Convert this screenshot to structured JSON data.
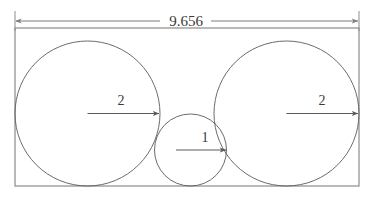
{
  "figure": {
    "colors": {
      "rectangle_stroke": "#8c8c8c",
      "circle_stroke": "#5a5a5a",
      "dimension_stroke": "#8c8c8c",
      "radius_leader_stroke": "#5a5a5a",
      "text": "#3a3a3a",
      "background": "#ffffff"
    },
    "overall_dimension": {
      "label": "9.656",
      "orientation": "horizontal",
      "position": "top",
      "arrowheads": "both-ends"
    },
    "circles": [
      {
        "name": "left-circle",
        "radius_label": "2",
        "cx": 87.5,
        "cy": 113.5,
        "r": 72.5,
        "leader_from_x": 87.5,
        "leader_to_x": 160,
        "leader_y": 113.5,
        "label_x": 120,
        "label_y": 105
      },
      {
        "name": "middle-circle",
        "radius_label": "1",
        "cx": 190.5,
        "cy": 150,
        "r": 36,
        "leader_from_x": 190.5,
        "leader_to_x": 226.5,
        "leader_y": 150,
        "label_x": 206,
        "label_y": 141
      },
      {
        "name": "right-circle",
        "radius_label": "2",
        "cx": 286.5,
        "cy": 113.5,
        "r": 72.5,
        "leader_from_x": 286.5,
        "leader_to_x": 359,
        "leader_y": 113.5,
        "label_x": 322,
        "label_y": 105
      }
    ],
    "rectangle": {
      "name": "bounding-rectangle",
      "x": 15,
      "y": 28,
      "width": 344,
      "height": 158
    },
    "dimension_line": {
      "y": 21,
      "x_start": 15,
      "x_end": 359,
      "text_gap_left": 160,
      "text_gap_right": 211,
      "extension_top": 11,
      "extension_bottom": 30
    }
  }
}
